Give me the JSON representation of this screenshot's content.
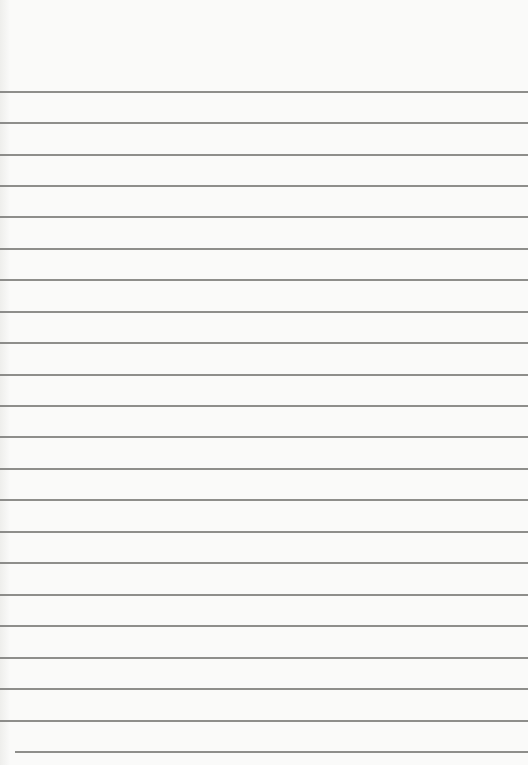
{
  "document": {
    "type": "lined-paper",
    "background_color": "#fafaf9",
    "rule_color": "#7a7a78",
    "rules": [
      {
        "y": 91,
        "x1": 0,
        "x2": 528
      },
      {
        "y": 122,
        "x1": 0,
        "x2": 528
      },
      {
        "y": 154,
        "x1": 0,
        "x2": 528
      },
      {
        "y": 185,
        "x1": 0,
        "x2": 528
      },
      {
        "y": 216,
        "x1": 0,
        "x2": 528
      },
      {
        "y": 248,
        "x1": 0,
        "x2": 528
      },
      {
        "y": 279,
        "x1": 0,
        "x2": 528
      },
      {
        "y": 311,
        "x1": 0,
        "x2": 528
      },
      {
        "y": 342,
        "x1": 0,
        "x2": 528
      },
      {
        "y": 374,
        "x1": 0,
        "x2": 528
      },
      {
        "y": 405,
        "x1": 0,
        "x2": 528
      },
      {
        "y": 436,
        "x1": 0,
        "x2": 528
      },
      {
        "y": 468,
        "x1": 0,
        "x2": 528
      },
      {
        "y": 499,
        "x1": 0,
        "x2": 528
      },
      {
        "y": 531,
        "x1": 0,
        "x2": 528
      },
      {
        "y": 562,
        "x1": 0,
        "x2": 528
      },
      {
        "y": 594,
        "x1": 0,
        "x2": 528
      },
      {
        "y": 625,
        "x1": 0,
        "x2": 528
      },
      {
        "y": 657,
        "x1": 0,
        "x2": 528
      },
      {
        "y": 688,
        "x1": 0,
        "x2": 528
      },
      {
        "y": 720,
        "x1": 0,
        "x2": 528
      },
      {
        "y": 751,
        "x1": 15,
        "x2": 528
      }
    ]
  }
}
